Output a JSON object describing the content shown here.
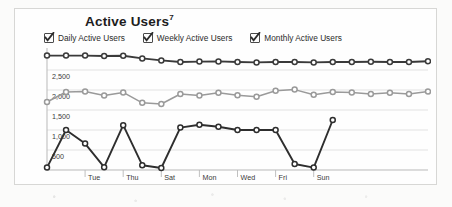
{
  "card": {
    "title": "Active Users",
    "title_footnote": "7"
  },
  "legend": {
    "items": [
      {
        "label": "Daily Active Users",
        "checked": true,
        "color": "#2e2e2e",
        "icon": "checkbox-checked-icon"
      },
      {
        "label": "Weekly Active Users",
        "checked": true,
        "color": "#8d8d8d",
        "icon": "checkbox-checked-icon"
      },
      {
        "label": "Monthly Active Users",
        "checked": true,
        "color": "#3a3a3a",
        "icon": "checkbox-checked-icon"
      }
    ]
  },
  "colors": {
    "monthly_line": "#3a3a3a",
    "weekly_line": "#9a9a9a",
    "daily_line": "#2e2e2e",
    "gridline": "#dcdcdc",
    "axis": "#b9b9b9",
    "marker_fill": "#ffffff",
    "card_border": "#d7d7d5",
    "card_background": "#fefefe",
    "page_background": "#fbfbfa"
  },
  "chart_data": {
    "type": "line",
    "title": "Active Users",
    "xlabel": "",
    "ylabel": "",
    "ylim": [
      0,
      3000
    ],
    "yticks": [
      500,
      1000,
      1500,
      2000,
      2500
    ],
    "ytick_labels": [
      "500",
      "1,000",
      "1,500",
      "2,000",
      "2,500"
    ],
    "grid": true,
    "legend_position": "top-left",
    "x": [
      1,
      2,
      3,
      4,
      5,
      6,
      7,
      8,
      9,
      10,
      11,
      12,
      13,
      14,
      15,
      16,
      17,
      18,
      19,
      20,
      21
    ],
    "categories": [
      "Mon",
      "Tue",
      "Wed",
      "Thu",
      "Fri",
      "Sat",
      "Sun",
      "Mon",
      "Tue",
      "Wed",
      "Thu",
      "Fri",
      "Sat",
      "Sun",
      "Mon",
      "Tue",
      "Wed",
      "Thu",
      "Fri",
      "Sat",
      "Sun"
    ],
    "xtick_indices": [
      2,
      4,
      6,
      8,
      10,
      12,
      14
    ],
    "xtick_labels": [
      "Tue",
      "Thu",
      "Sat",
      "Mon",
      "Wed",
      "Fri",
      "Sun"
    ],
    "series": [
      {
        "name": "Monthly Active Users",
        "color": "#3a3a3a",
        "values": [
          2860,
          2860,
          2860,
          2850,
          2855,
          2790,
          2740,
          2700,
          2710,
          2715,
          2700,
          2690,
          2700,
          2700,
          2690,
          2700,
          2700,
          2705,
          2700,
          2700,
          2720
        ]
      },
      {
        "name": "Weekly Active Users",
        "color": "#9a9a9a",
        "values": [
          1700,
          1950,
          1960,
          1860,
          1940,
          1680,
          1650,
          1900,
          1860,
          1930,
          1870,
          1830,
          1980,
          2010,
          1880,
          1950,
          1940,
          1900,
          1930,
          1900,
          1960
        ]
      },
      {
        "name": "Daily Active Users",
        "color": "#2e2e2e",
        "values": [
          60,
          1000,
          660,
          70,
          1120,
          120,
          50,
          1060,
          1130,
          1080,
          1000,
          1000,
          1000,
          150,
          60,
          1250,
          0,
          0,
          0,
          0,
          0
        ]
      }
    ]
  }
}
